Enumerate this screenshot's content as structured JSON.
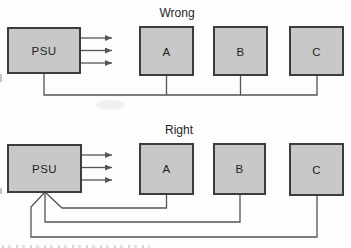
{
  "colors": {
    "page_bg": "#fdfdfd",
    "box_fill": "#c8c8c8",
    "box_border": "#3c3c3c",
    "wire": "#555555",
    "text": "#1f1f1f"
  },
  "wrong": {
    "title": "Wrong",
    "psu": "PSU",
    "devices": [
      "A",
      "B",
      "C"
    ]
  },
  "right": {
    "title": "Right",
    "psu": "PSU",
    "devices": [
      "A",
      "B",
      "C"
    ]
  }
}
